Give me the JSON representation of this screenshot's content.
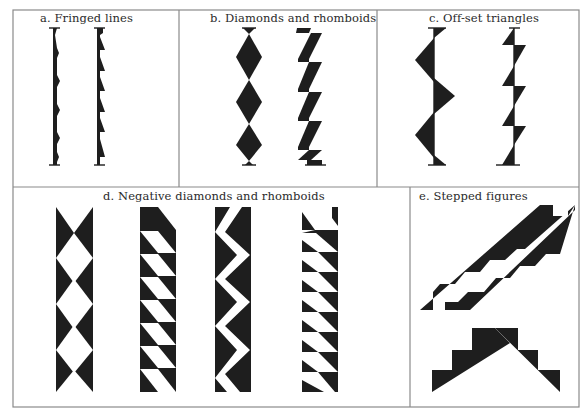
{
  "figure": {
    "panels": [
      {
        "id": "a",
        "title": "a. Fringed lines"
      },
      {
        "id": "b",
        "title": "b. Diamonds and rhomboids"
      },
      {
        "id": "c",
        "title": "c. Off-set triangles"
      },
      {
        "id": "d",
        "title": "d. Negative diamonds and rhomboids"
      },
      {
        "id": "e",
        "title": "e. Stepped figures"
      }
    ],
    "colors": {
      "ink": "#1e1e1e",
      "frame": "#8a8a8a",
      "paper": "#ffffff"
    }
  }
}
